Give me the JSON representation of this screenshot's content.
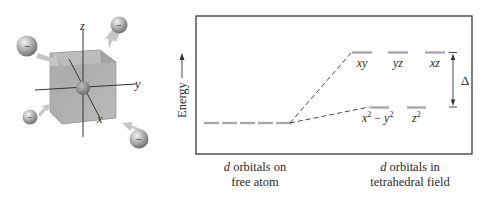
{
  "figure": {
    "left_panel": {
      "title": "Tetrahedral ligand arrangement around a metal atom inside a cube",
      "axes": {
        "x": "x",
        "y": "y",
        "z": "z"
      },
      "ligand_charge_symbol": "−",
      "ligand_count": 4
    },
    "right_panel": {
      "y_axis_label": "Energy",
      "free_atom": {
        "caption_prefix": "d",
        "caption_rest_line1": " orbitals on",
        "caption_line2": "free atom",
        "orbital_count": 5
      },
      "tetrahedral_field": {
        "caption_prefix": "d",
        "caption_rest_line1": " orbitals in",
        "caption_line2": "tetrahedral field",
        "upper_set": [
          "xy",
          "yz",
          "xz"
        ],
        "lower_set": [
          "x² − y²",
          "z²"
        ],
        "lower_set_parts": {
          "x2y2_x": "x",
          "x2y2_minus": " − ",
          "x2y2_y": "y",
          "sup": "2",
          "z2_z": "z"
        },
        "splitting_label": "Δ"
      }
    },
    "colors": {
      "level_bar": "#a9a9a9",
      "box_border": "#3a3a3a",
      "cube_fill": "#9a9a9a",
      "ligand_sphere": "#8c8c8c",
      "arrow_fill": "#c8c8c8"
    }
  }
}
